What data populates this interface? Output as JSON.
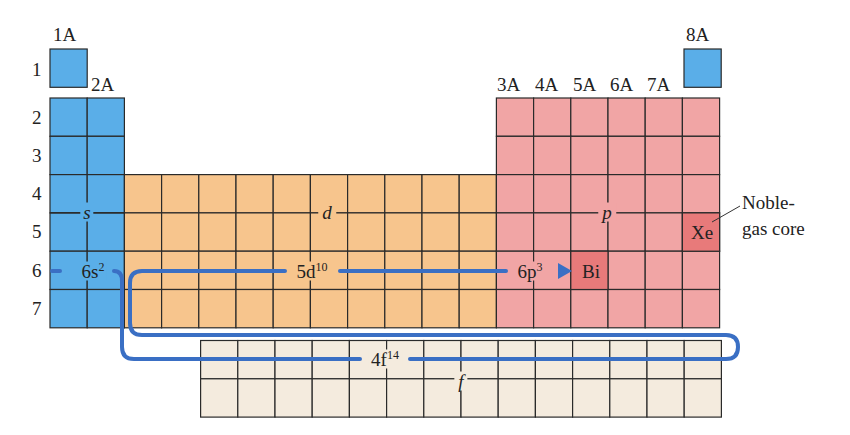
{
  "figure": {
    "top_clipped_text": "interior of a box of vertically",
    "group_labels": [
      "1A",
      "2A",
      "3A",
      "4A",
      "5A",
      "6A",
      "7A",
      "8A"
    ],
    "period_labels": [
      "1",
      "2",
      "3",
      "4",
      "5",
      "6",
      "7"
    ],
    "blocks": {
      "s": {
        "label": "s",
        "color": "#5aaee8"
      },
      "d": {
        "label": "d",
        "color": "#f7c58d"
      },
      "p": {
        "label": "p",
        "color": "#f1a5a5"
      },
      "f": {
        "label": "f",
        "color": "#f4ebde"
      }
    },
    "highlight_color": "#e87a7a",
    "path_color": "#3a6fc4",
    "grid_color": "#2a2a2a",
    "configuration_segments": [
      {
        "base": "6s",
        "sup": "2"
      },
      {
        "base": "4f",
        "sup": "14"
      },
      {
        "base": "5d",
        "sup": "10"
      },
      {
        "base": "6p",
        "sup": "3"
      }
    ],
    "elements": {
      "xe": "Xe",
      "bi": "Bi"
    },
    "annotation": {
      "line1": "Noble-",
      "line2": "gas core"
    }
  }
}
